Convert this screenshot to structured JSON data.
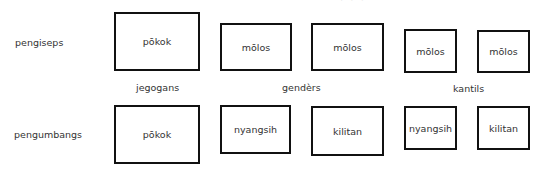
{
  "diagram": {
    "rows": [
      {
        "label": "pengiseps",
        "boxes": [
          {
            "text": "pōkok",
            "group": "jegogans"
          },
          {
            "text": "mōlos",
            "group": "gendèrs"
          },
          {
            "text": "mōlos",
            "group": "gendèrs"
          },
          {
            "text": "mōlos",
            "group": "kantils"
          },
          {
            "text": "mōlos",
            "group": "kantils"
          }
        ]
      },
      {
        "label": "pengumbangs",
        "boxes": [
          {
            "text": "pōkok",
            "group": "jegogans"
          },
          {
            "text": "nyangsih",
            "group": "gendèrs"
          },
          {
            "text": "kilitan",
            "group": "gendèrs"
          },
          {
            "text": "nyangsih",
            "group": "kantils"
          },
          {
            "text": "kilitan",
            "group": "kantils"
          }
        ]
      }
    ],
    "groups": [
      "jegogans",
      "gendèrs",
      "kantils"
    ],
    "border_color": "#111111",
    "text_color": "#333333"
  }
}
